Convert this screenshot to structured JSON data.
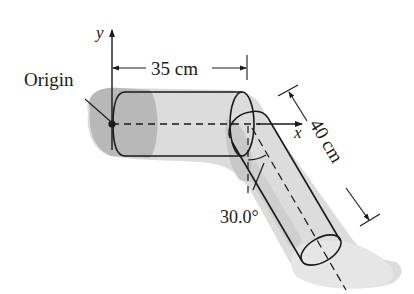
{
  "diagram": {
    "labels": {
      "origin": "Origin",
      "x_axis": "x",
      "y_axis": "y",
      "upper_length": "35 cm",
      "lower_length": "40 cm",
      "angle": "30.0°"
    },
    "values": {
      "upper_segment_cm": 35,
      "lower_segment_cm": 40,
      "knee_angle_deg": 30.0
    },
    "colors": {
      "line": "#1a1a1a",
      "shadow_dark": "#b5b5b5",
      "shadow_light": "#dcdcdc",
      "background": "#ffffff"
    }
  }
}
